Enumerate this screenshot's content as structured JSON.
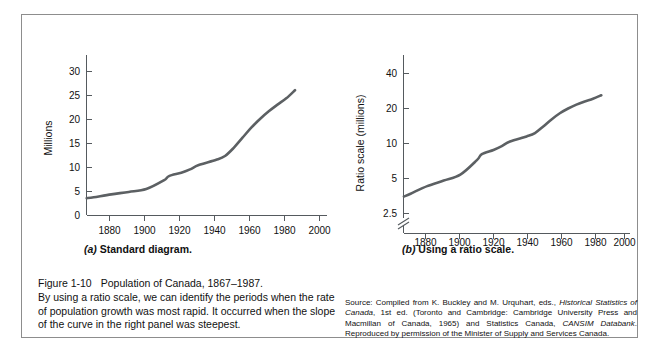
{
  "figure": {
    "number": "Figure 1-10",
    "title": "Population of Canada, 1867–1987.",
    "body": "By using a ratio scale, we can identify the periods when the rate of population growth was most rapid. It occurred when the slope of the curve in the right panel was steepest.",
    "source_prefix": "Source: Compiled from K. Buckley and M. Urquhart, eds., ",
    "source_italic_1": "Historical Statistics of Canada",
    "source_mid_1": ", 1st ed. (Toronto and Cambridge: Cambridge University Press and Macmillan of Canada, 1965) and Statistics Canada, ",
    "source_italic_2": "CANSIM Databank",
    "source_suffix": ". Reproduced by permission of the Minister of Supply and Services Canada."
  },
  "panel_a": {
    "label_paren": "(a)",
    "label_text": "Standard diagram."
  },
  "panel_b": {
    "label_paren": "(b)",
    "label_text": "Using a ratio scale."
  },
  "chart_data": [
    {
      "type": "line",
      "title": "Standard diagram.",
      "panel": "a",
      "xlabel": "",
      "ylabel": "Millions",
      "xlim": [
        1867,
        2005
      ],
      "ylim": [
        0,
        33
      ],
      "yscale": "linear",
      "grid": false,
      "legend": "none",
      "xticks": [
        1880,
        1900,
        1920,
        1940,
        1960,
        1980,
        2000
      ],
      "xticklabels": [
        "1880",
        "1900",
        "1920",
        "1940",
        "1960",
        "1980",
        "2000"
      ],
      "yticks": [
        0,
        5,
        10,
        15,
        20,
        25,
        30
      ],
      "yticklabels": [
        "0",
        "5",
        "10",
        "15",
        "20",
        "25",
        "30"
      ],
      "series": [
        {
          "name": "Population of Canada (millions)",
          "x": [
            1867,
            1871,
            1881,
            1891,
            1901,
            1911,
            1914,
            1921,
            1926,
            1931,
            1941,
            1946,
            1951,
            1956,
            1961,
            1966,
            1971,
            1976,
            1981,
            1986
          ],
          "values": [
            3.5,
            3.7,
            4.3,
            4.8,
            5.4,
            7.2,
            8.1,
            8.8,
            9.5,
            10.4,
            11.5,
            12.3,
            14.0,
            16.1,
            18.2,
            20.0,
            21.6,
            23.0,
            24.3,
            26.0
          ]
        }
      ]
    },
    {
      "type": "line",
      "title": "Using a ratio scale.",
      "panel": "b",
      "xlabel": "",
      "ylabel": "Ratio scale (millions)",
      "xlim": [
        1867,
        2005
      ],
      "ylim": [
        2.0,
        56
      ],
      "yscale": "log",
      "axis_break": true,
      "grid": false,
      "legend": "none",
      "xticks": [
        1880,
        1900,
        1920,
        1940,
        1960,
        1980,
        2000
      ],
      "xticklabels": [
        "1880",
        "1900",
        "1920",
        "1940",
        "1960",
        "1980",
        "2000"
      ],
      "yticks": [
        2.5,
        5,
        10,
        20,
        40
      ],
      "yticklabels": [
        "2.5",
        "5",
        "10",
        "20",
        "40"
      ],
      "series": [
        {
          "name": "Population of Canada (millions, log scale)",
          "x": [
            1867,
            1871,
            1881,
            1891,
            1901,
            1911,
            1914,
            1921,
            1926,
            1931,
            1941,
            1946,
            1951,
            1956,
            1961,
            1966,
            1971,
            1976,
            1981,
            1986
          ],
          "values": [
            3.5,
            3.7,
            4.3,
            4.8,
            5.4,
            7.2,
            8.1,
            8.8,
            9.5,
            10.4,
            11.5,
            12.3,
            14.0,
            16.1,
            18.2,
            20.0,
            21.6,
            23.0,
            24.3,
            26.0
          ]
        }
      ]
    }
  ]
}
